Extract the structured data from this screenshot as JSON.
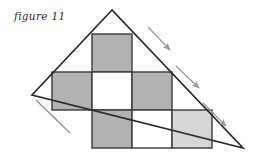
{
  "figure": {
    "caption": "figure 11",
    "type": "geometry-diagram",
    "canvas": {
      "width": 260,
      "height": 161,
      "background": "#ffffff"
    }
  },
  "colors": {
    "outline": "#2a2a2a",
    "grid_line": "#3a3a3a",
    "shaded_dark": "#b5b5b5",
    "shaded_light": "#d9d9d9",
    "unshaded": "#ffffff",
    "arrow": "#9a9a9a",
    "crease": "#8d8d8d",
    "text": "#2b2b2b"
  },
  "triangle": {
    "name": "right-triangle",
    "vertices": [
      {
        "label": "apex",
        "x": 112,
        "y": 10
      },
      {
        "label": "left",
        "x": 32,
        "y": 95
      },
      {
        "label": "bottom-right",
        "x": 243,
        "y": 148
      }
    ],
    "stroke_width": 1.6
  },
  "grid": {
    "columns_x": [
      52,
      92,
      132,
      172,
      212
    ],
    "rows_y": [
      34,
      72,
      110,
      148
    ],
    "cell_size": 40,
    "cells": [
      {
        "row": 0,
        "col": 1,
        "x": 92,
        "y": 34,
        "w": 40,
        "h": 38,
        "fill": "shaded_dark",
        "name": "cell-r0-c1"
      },
      {
        "row": 1,
        "col": 0,
        "x": 52,
        "y": 72,
        "w": 40,
        "h": 38,
        "fill": "shaded_dark",
        "name": "cell-r1-c0"
      },
      {
        "row": 1,
        "col": 1,
        "x": 92,
        "y": 72,
        "w": 40,
        "h": 38,
        "fill": "unshaded",
        "name": "cell-r1-c1"
      },
      {
        "row": 1,
        "col": 2,
        "x": 132,
        "y": 72,
        "w": 40,
        "h": 38,
        "fill": "shaded_dark",
        "name": "cell-r1-c2"
      },
      {
        "row": 2,
        "col": 1,
        "x": 92,
        "y": 110,
        "w": 40,
        "h": 38,
        "fill": "shaded_dark",
        "name": "cell-r2-c1"
      },
      {
        "row": 2,
        "col": 2,
        "x": 132,
        "y": 110,
        "w": 40,
        "h": 38,
        "fill": "unshaded",
        "name": "cell-r2-c2"
      },
      {
        "row": 2,
        "col": 3,
        "x": 172,
        "y": 110,
        "w": 40,
        "h": 38,
        "fill": "shaded_light",
        "name": "cell-r2-c3"
      }
    ]
  },
  "arrows": [
    {
      "name": "fold-arrow-1",
      "x1": 148,
      "y1": 27,
      "x2": 172,
      "y2": 52
    },
    {
      "name": "fold-arrow-2",
      "x1": 176,
      "y1": 66,
      "x2": 201,
      "y2": 90
    },
    {
      "name": "fold-arrow-3",
      "x1": 203,
      "y1": 103,
      "x2": 228,
      "y2": 128
    }
  ],
  "crease": {
    "name": "crease-line",
    "x1": 36,
    "y1": 100,
    "x2": 70,
    "y2": 133
  }
}
